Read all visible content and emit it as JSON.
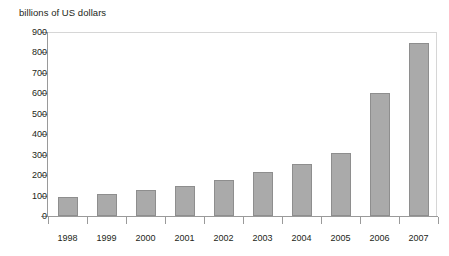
{
  "chart_data": {
    "type": "bar",
    "title": "billions of US dollars",
    "xlabel": "",
    "ylabel": "",
    "categories": [
      "1998",
      "1999",
      "2000",
      "2001",
      "2002",
      "2003",
      "2004",
      "2005",
      "2006",
      "2007"
    ],
    "values": [
      95,
      108,
      128,
      148,
      175,
      215,
      255,
      310,
      600,
      845
    ],
    "ylim": [
      0,
      900
    ],
    "ytick_labels": [
      "900",
      "800",
      "700",
      "600",
      "500",
      "400",
      "300",
      "200",
      "100",
      "0"
    ],
    "ytick_values": [
      900,
      800,
      700,
      600,
      500,
      400,
      300,
      200,
      100,
      0
    ],
    "grid": false,
    "legend": "none",
    "bar_color": "#aaaaaa",
    "bar_border_color": "#8e8e8e",
    "axis_color": "#9a9a9a",
    "frame_color": "#d6d6d6",
    "text_color": "#231f20"
  }
}
